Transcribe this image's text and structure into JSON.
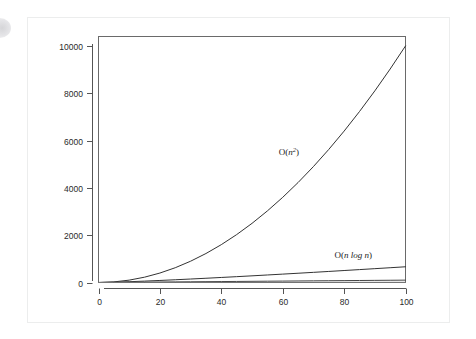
{
  "figure": {
    "name": "algorithmic-complexity-growth-chart",
    "background_color": "#ffffff",
    "card_border_color": "#eceded",
    "axis_color": "#555555",
    "frame_color": "#6a6a6a"
  },
  "chart_data": {
    "type": "line",
    "title": "",
    "subtitle": "",
    "xlabel": "",
    "ylabel": "",
    "xlim": [
      0,
      100
    ],
    "ylim": [
      0,
      10400
    ],
    "grid": false,
    "legend_position": "inline-annotations",
    "xticks": [
      0,
      20,
      40,
      60,
      80,
      100
    ],
    "xtick_labels": [
      "0",
      "20",
      "40",
      "60",
      "80",
      "100"
    ],
    "yticks": [
      0,
      2000,
      4000,
      6000,
      8000,
      10000
    ],
    "ytick_labels": [
      "0",
      "2000",
      "4000",
      "6000",
      "8000",
      "10000"
    ],
    "x": [
      0,
      5,
      10,
      15,
      20,
      25,
      30,
      35,
      40,
      45,
      50,
      55,
      60,
      65,
      70,
      75,
      80,
      85,
      90,
      95,
      100
    ],
    "series": [
      {
        "name": "O(n^2)",
        "label": "O(n²)",
        "color": "#333333",
        "width": 1.0,
        "values": [
          0,
          25,
          100,
          225,
          400,
          625,
          900,
          1225,
          1600,
          2025,
          2500,
          3025,
          3600,
          4225,
          4900,
          5625,
          6400,
          7225,
          8100,
          9025,
          10000
        ]
      },
      {
        "name": "O(n log n)",
        "label": "O(n log n)",
        "color": "#333333",
        "width": 1.0,
        "values": [
          0,
          11.6,
          33.2,
          58.6,
          86.4,
          116.1,
          147.2,
          179.4,
          212.9,
          247.0,
          282.0,
          317.8,
          354.4,
          391.5,
          429.2,
          467.5,
          506.2,
          545.4,
          584.9,
          624.8,
          664.4
        ]
      },
      {
        "name": "O(n)",
        "label": "O(n)",
        "color": "#444444",
        "width": 1.0,
        "values": [
          0,
          5,
          10,
          15,
          20,
          25,
          30,
          35,
          40,
          45,
          50,
          55,
          60,
          65,
          70,
          75,
          80,
          85,
          90,
          95,
          100
        ]
      },
      {
        "name": "O(log n)",
        "label": "O(log n)",
        "color": "#777777",
        "width": 1.0,
        "values": [
          0,
          2.32,
          3.32,
          3.91,
          4.32,
          4.64,
          4.91,
          5.13,
          5.32,
          5.49,
          5.64,
          5.78,
          5.91,
          6.02,
          6.13,
          6.23,
          6.32,
          6.41,
          6.49,
          6.57,
          6.64
        ]
      }
    ],
    "annotations": [
      {
        "name": "n-squared-label",
        "text": "O(n²)",
        "x": 62,
        "y": 5400
      },
      {
        "name": "n-log-n-label",
        "text": "O(n log n)",
        "x": 83,
        "y": 1050
      }
    ]
  }
}
